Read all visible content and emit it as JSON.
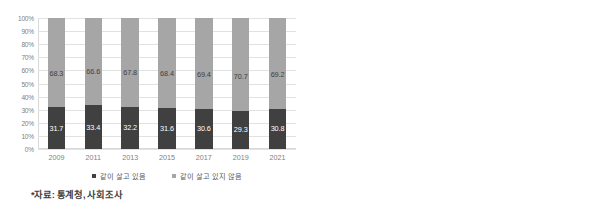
{
  "chart_data": [
    {
      "type": "bar",
      "id": "left",
      "title": "",
      "subtype": "100% stacked column",
      "categories": [
        "2009",
        "2011",
        "2013",
        "2015",
        "2017",
        "2019",
        "2021"
      ],
      "series": [
        {
          "name": "같이 살고 있음",
          "color": "#404040",
          "values": [
            31.7,
            33.4,
            32.2,
            31.6,
            30.6,
            29.3,
            30.8
          ]
        },
        {
          "name": "같이 살고 있지 않음",
          "color": "#a6a6a6",
          "values": [
            68.3,
            66.6,
            67.8,
            68.4,
            69.4,
            70.7,
            69.2
          ]
        }
      ],
      "xlabel": "",
      "ylabel": "",
      "ylim": [
        0,
        100
      ],
      "yticks": [
        "0%",
        "10%",
        "20%",
        "30%",
        "40%",
        "50%",
        "60%",
        "70%",
        "80%",
        "90%",
        "100%"
      ],
      "grid": true,
      "legend_position": "bottom",
      "note": "*자료: 통계청, 사회조사"
    },
    {
      "type": "line",
      "id": "right",
      "title": "",
      "x": [
        "2009",
        "2011",
        "2013",
        "2015",
        "2017",
        "2019",
        "2021"
      ],
      "series": [
        {
          "name": "60-64세",
          "color": "#a6a6a6",
          "values": [
            38.2,
            38.7,
            41.5,
            40.0,
            37.6,
            37.0,
            38.6
          ]
        },
        {
          "name": "65-69세",
          "color": "#bfbfbf",
          "values": [
            29.4,
            33.4,
            30.0,
            30.1,
            29.6,
            25.7,
            27.1
          ]
        },
        {
          "name": "70-79세",
          "color": "#7f7f7f",
          "values": [
            27.6,
            27.4,
            26.0,
            26.3,
            25.0,
            23.4,
            24.6
          ]
        },
        {
          "name": "80세 이상",
          "color": "#262626",
          "values": [
            32.9,
            38.9,
            32.5,
            30.2,
            31.4,
            31.2,
            32.3
          ]
        }
      ],
      "xlabel": "",
      "ylabel": "",
      "ylim": [
        15.0,
        45.0
      ],
      "yticks": [
        "15.0",
        "20.0",
        "25.0",
        "30.0",
        "35.0",
        "40.0",
        "45.0"
      ],
      "grid": true,
      "legend_position": "bottom"
    }
  ]
}
